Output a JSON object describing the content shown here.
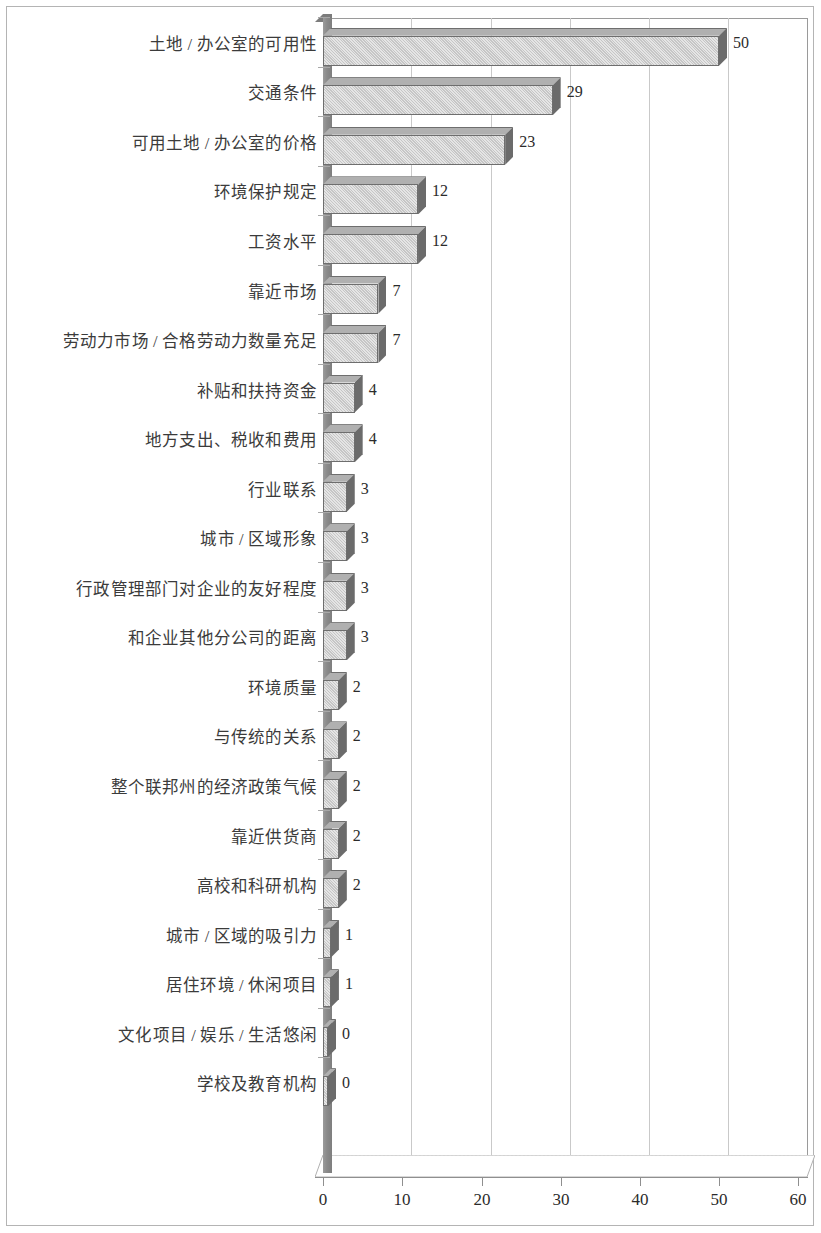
{
  "chart_data": {
    "type": "bar",
    "orientation": "horizontal",
    "title": "",
    "subtitle": "",
    "xlabel": "",
    "ylabel": "",
    "xlim": [
      0,
      60
    ],
    "xticks": [
      "0",
      "10",
      "20",
      "30",
      "40",
      "50",
      "60"
    ],
    "grid": "vertical",
    "legend": "none",
    "style": "3d-bar",
    "bar_fill_color": "#c6c6c6",
    "bar_edge_color": "#6e6e6e",
    "bar_side_color": "#6b6b6b",
    "axis_wall_color": "#858585",
    "gridline_color": "#c9c9c9",
    "categories": [
      "土地 / 办公室的可用性",
      "交通条件",
      "可用土地 / 办公室的价格",
      "环境保护规定",
      "工资水平",
      "靠近市场",
      "劳动力市场 / 合格劳动力数量充足",
      "补贴和扶持资金",
      "地方支出、税收和费用",
      "行业联系",
      "城市 / 区域形象",
      "行政管理部门对企业的友好程度",
      "和企业其他分公司的距离",
      "环境质量",
      "与传统的关系",
      "整个联邦州的经济政策气候",
      "靠近供货商",
      "高校和科研机构",
      "城市 / 区域的吸引力",
      "居住环境 / 休闲项目",
      "文化项目 / 娱乐 / 生活悠闲",
      "学校及教育机构"
    ],
    "values": [
      50,
      29,
      23,
      12,
      12,
      7,
      7,
      4,
      4,
      3,
      3,
      3,
      3,
      2,
      2,
      2,
      2,
      2,
      1,
      1,
      0,
      0
    ],
    "value_labels": [
      "50",
      "29",
      "23",
      "12",
      "12",
      "7",
      "7",
      "4",
      "4",
      "3",
      "3",
      "3",
      "3",
      "2",
      "2",
      "2",
      "2",
      "2",
      "1",
      "1",
      "0",
      "0"
    ]
  }
}
